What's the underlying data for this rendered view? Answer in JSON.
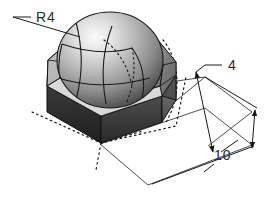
{
  "drawing": {
    "type": "isometric-engineering-drawing",
    "title": "Hexagonal prism with spherical dome cavity",
    "background_color": "#ffffff",
    "line_color": "#1a1a1a",
    "projection": "isometric",
    "annotations": [
      {
        "id": "radius",
        "label": "R4",
        "meaning": "sphere-radius",
        "value": 4,
        "prefix": "R",
        "x": 36,
        "y": 22,
        "leader": {
          "style": "solid",
          "horizontal_start": [
            13,
            17
          ],
          "horizontal_end": [
            31,
            17
          ],
          "target": [
            80,
            37
          ]
        }
      },
      {
        "id": "height",
        "label": "4",
        "meaning": "prism-height",
        "value": 4,
        "x": 228,
        "y": 70,
        "leader": {
          "style": "solid",
          "horizontal_start": [
            205,
            65
          ],
          "horizontal_end": [
            222,
            65
          ],
          "target": [
            196,
            72
          ]
        }
      },
      {
        "id": "width",
        "label": "10",
        "meaning": "across-flats-width",
        "value": 10,
        "x": 218,
        "y": 158,
        "leader": {
          "style": "solid",
          "target_upper": [
            205,
            140
          ],
          "target_lower": [
            212,
            170
          ]
        }
      }
    ],
    "geometry": {
      "solid": "hexagonal-prism",
      "feature": "spherical-cap",
      "shading": "grayscale-gradient",
      "hidden_lines": "dotted",
      "face_tones": {
        "top_bevel_light": "#d8d8d8",
        "top_bevel_mid": "#9a9a9a",
        "front_left_dark": "#2e2e2e",
        "front_right_dark": "#3c3c3c",
        "side_mid": "#6a6a6a",
        "sphere_highlight": "#f2f2f2",
        "sphere_mid": "#b4b4b4",
        "sphere_shadow": "#4a4a4a"
      }
    }
  }
}
